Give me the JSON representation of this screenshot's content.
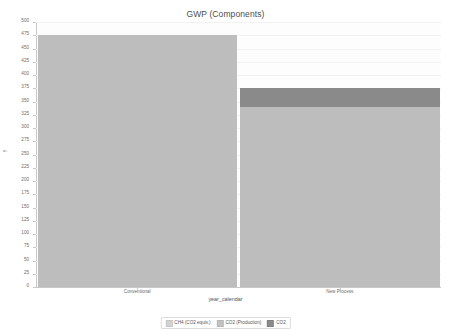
{
  "chart_data": {
    "type": "bar",
    "stacked": true,
    "title": "GWP (Components)",
    "xlabel": "year_calendar",
    "ylabel": "y",
    "categories": [
      "Conventional",
      "New Process"
    ],
    "series": [
      {
        "name": "CH4 (CO2 equiv.)",
        "color": "#c9c9c9",
        "values": [
          0,
          0
        ]
      },
      {
        "name": "CO2 (Production)",
        "color": "#bdbdbd",
        "values": [
          475,
          340
        ]
      },
      {
        "name": "CO2",
        "color": "#8a8a8a",
        "values": [
          0,
          35
        ]
      }
    ],
    "ylim": [
      0,
      500
    ],
    "yticks": [
      0,
      25,
      50,
      75,
      100,
      125,
      150,
      175,
      200,
      225,
      250,
      275,
      300,
      325,
      350,
      375,
      400,
      425,
      450,
      475,
      500
    ],
    "grid": true,
    "legend_position": "bottom",
    "bar_totals": [
      475,
      375
    ]
  },
  "legend": {
    "items": [
      {
        "label": "CH4 (CO2 equiv.)",
        "color": "#d2d2d2"
      },
      {
        "label": "CO2 (Production)",
        "color": "#c2c2c2"
      },
      {
        "label": "CO2",
        "color": "#8a8a8a"
      }
    ]
  },
  "colors": {
    "plot_background": "#fdfdfd",
    "page_background": "#ffffff",
    "axis": "#c8c8c8",
    "gridline": "#f2f2f2",
    "tick_text": "#6b6b6b",
    "title_text": "#4d4d4d"
  }
}
